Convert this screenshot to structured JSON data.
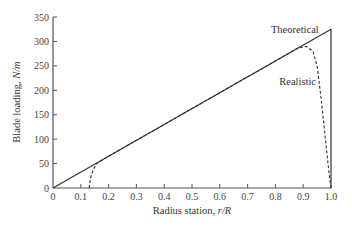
{
  "chart_data": {
    "type": "line",
    "title": "",
    "xlabel": "Radius station, r/R",
    "xlabel_parts": {
      "prefix": "Radius station, ",
      "var": "r/R"
    },
    "ylabel": "Blade loading, N/m",
    "ylabel_parts": {
      "prefix": "Blade loading, ",
      "var": "N/m"
    },
    "xlim": [
      0,
      1.0
    ],
    "ylim": [
      0,
      350
    ],
    "x_ticks": [
      "0",
      "0.1",
      "0.2",
      "0.3",
      "0.4",
      "0.5",
      "0.6",
      "0.7",
      "0.8",
      "0.9",
      "1.0"
    ],
    "y_ticks": [
      "0",
      "50",
      "100",
      "150",
      "200",
      "250",
      "300",
      "350"
    ],
    "grid": false,
    "legend": null,
    "series": [
      {
        "name": "Theoretical",
        "style": "solid",
        "points": [
          [
            0,
            0
          ],
          [
            1.0,
            325
          ],
          [
            1.0,
            0
          ]
        ]
      },
      {
        "name": "Realistic",
        "style": "dashed",
        "points": [
          [
            0.13,
            0
          ],
          [
            0.135,
            20
          ],
          [
            0.145,
            38
          ],
          [
            0.16,
            52
          ],
          [
            0.2,
            65
          ],
          [
            0.4,
            130
          ],
          [
            0.6,
            195
          ],
          [
            0.8,
            260
          ],
          [
            0.88,
            286
          ],
          [
            0.91,
            290
          ],
          [
            0.935,
            280
          ],
          [
            0.95,
            250
          ],
          [
            0.965,
            180
          ],
          [
            0.98,
            100
          ],
          [
            0.995,
            20
          ],
          [
            1.0,
            0
          ]
        ]
      }
    ],
    "annotations": [
      {
        "text": "Theoretical",
        "x": 0.87,
        "y": 318
      },
      {
        "text": "Realistic",
        "x": 0.88,
        "y": 210
      }
    ]
  }
}
